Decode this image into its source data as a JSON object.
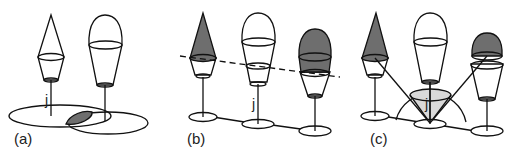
{
  "figure": {
    "panels": [
      {
        "id": "a",
        "label": "(a)",
        "node_label": "j"
      },
      {
        "id": "b",
        "label": "(b)",
        "node_label": "j"
      },
      {
        "id": "c",
        "label": "(c)",
        "node_label": "j"
      }
    ],
    "colors": {
      "stroke": "#111111",
      "dark_fill": "#6e6e6e",
      "light_fill": "#d9d9d9",
      "background": "#ffffff"
    }
  }
}
